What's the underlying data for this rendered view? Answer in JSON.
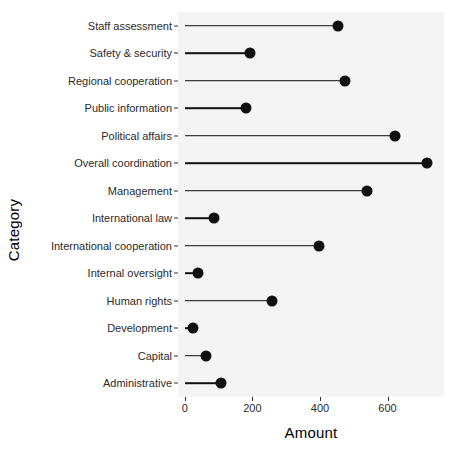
{
  "chart_data": {
    "type": "bar",
    "subtype": "lollipop-horizontal",
    "title": "",
    "xlabel": "Amount",
    "ylabel": "Category",
    "xlim": [
      -20,
      767
    ],
    "xticks": [
      0,
      200,
      400,
      600
    ],
    "xticklabels": [
      "0",
      "200",
      "400",
      "600"
    ],
    "grid": false,
    "legend": null,
    "orientation": "horizontal",
    "categories": [
      "Staff assessment",
      "Safety & security",
      "Regional cooperation",
      "Public information",
      "Political affairs",
      "Overall coordination",
      "Management",
      "International law",
      "International cooperation",
      "Internal oversight",
      "Human rights",
      "Development",
      "Capital",
      "Administrative"
    ],
    "values": [
      452,
      192,
      473,
      180,
      623,
      716,
      538,
      87,
      397,
      38,
      258,
      24,
      63,
      107
    ],
    "marker_color": "#111111",
    "stem_color": "#111111",
    "panel_background": "#f4f4f4",
    "page_background": "#ffffff"
  },
  "axes": {
    "y_title": "Category",
    "x_title": "Amount"
  }
}
